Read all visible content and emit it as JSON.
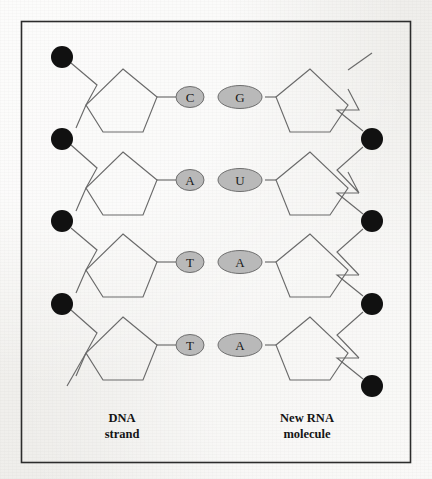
{
  "figure": {
    "background_color": "#f2f1ee",
    "border_color": "#2c2c2c",
    "stroke_color": "#5a5a5a",
    "phosphate_color": "#111111",
    "base_fill_color": "#b9b9b9",
    "base_stroke_color": "#6e6e6e"
  },
  "labels": {
    "left": {
      "line1": "DNA",
      "line2": "strand"
    },
    "right": {
      "line1": "New RNA",
      "line2": "molecule"
    }
  },
  "base_pairs": [
    {
      "left_base": "C",
      "right_base": "G",
      "left_type": "pyrimidine",
      "right_type": "purine"
    },
    {
      "left_base": "A",
      "right_base": "U",
      "left_type": "purine",
      "right_type": "pyrimidine"
    },
    {
      "left_base": "T",
      "right_base": "A",
      "left_type": "pyrimidine",
      "right_type": "purine"
    },
    {
      "left_base": "T",
      "right_base": "A",
      "left_type": "pyrimidine",
      "right_type": "purine"
    }
  ],
  "left_strand": {
    "name": "DNA strand",
    "sequence": "C A T T",
    "phosphate_count": 4,
    "sugar_count": 4,
    "sugar_name": "deoxyribose",
    "free_end": "bottom-left"
  },
  "right_strand": {
    "name": "New RNA molecule",
    "sequence": "G U A A",
    "phosphate_count": 4,
    "sugar_count": 4,
    "sugar_name": "ribose",
    "free_end": "top-right"
  },
  "geometry": {
    "border": {
      "x": 21,
      "y": 21,
      "width": 390,
      "height": 442
    },
    "row_y": [
      97,
      180,
      262,
      345
    ],
    "left_phosphate_y": [
      57,
      139,
      221,
      304
    ],
    "right_phosphate_y": [
      139,
      221,
      304,
      386
    ],
    "left_phosphate_x": 62,
    "right_phosphate_x": 372,
    "phosphate_radius": 11,
    "pyrimidine_rx": 14,
    "pyrimidine_ry": 10.5,
    "purine_rx": 22,
    "purine_ry": 11.5,
    "left_base_cx": 190,
    "right_base_cx": 243,
    "caption_y": [
      418,
      434
    ]
  }
}
